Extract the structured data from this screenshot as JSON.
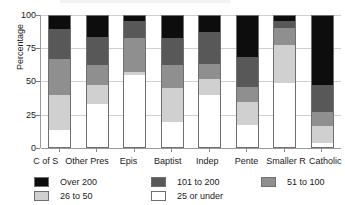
{
  "chart_data": {
    "type": "bar",
    "subtype": "stacked-percentage-column",
    "title": "",
    "xlabel": "",
    "ylabel": "Percentage",
    "ylim": [
      0,
      100
    ],
    "yticks": [
      0,
      25,
      50,
      75,
      100
    ],
    "ytick_labels": [
      "0",
      "25",
      "50",
      "75",
      "100"
    ],
    "grid": true,
    "legend_position": "bottom",
    "categories": [
      "C of S",
      "Other Pres",
      "Epis",
      "Baptist",
      "Indep",
      "Pente",
      "Smaller R",
      "Catholic"
    ],
    "series": [
      {
        "name": "25 or under",
        "color": "#ffffff",
        "values": [
          13,
          33,
          55,
          19,
          40,
          17,
          49,
          3
        ]
      },
      {
        "name": "26 to 50",
        "color": "#d0d0d0",
        "values": [
          27,
          14,
          2,
          26,
          12,
          17,
          29,
          13
        ]
      },
      {
        "name": "51 to 100",
        "color": "#8f8f8f",
        "values": [
          27,
          16,
          26,
          18,
          11,
          12,
          13,
          11
        ]
      },
      {
        "name": "101 to 200",
        "color": "#585858",
        "values": [
          23,
          21,
          13,
          20,
          25,
          23,
          5,
          20
        ]
      },
      {
        "name": "Over 200",
        "color": "#0d0d0d",
        "values": [
          10,
          16,
          4,
          17,
          12,
          31,
          4,
          53
        ]
      }
    ]
  },
  "legend": {
    "items": [
      {
        "label": "Over 200",
        "color": "#0d0d0d"
      },
      {
        "label": "101 to 200",
        "color": "#585858"
      },
      {
        "label": "51 to 100",
        "color": "#8f8f8f"
      },
      {
        "label": "26 to 50",
        "color": "#d0d0d0"
      },
      {
        "label": "25 or under",
        "color": "#ffffff"
      }
    ]
  },
  "axes": {
    "y_title": "Percentage",
    "y_tick_labels": [
      "100",
      "75",
      "50",
      "25",
      "0"
    ],
    "x_tick_labels": [
      "C of S",
      "Other Pres",
      "Epis",
      "Baptist",
      "Indep",
      "Pente",
      "Smaller R",
      "Catholic"
    ]
  }
}
